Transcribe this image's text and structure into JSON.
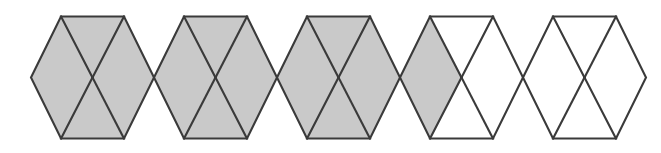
{
  "figure": {
    "shape_name": "hexagon",
    "hexagon_count": 5,
    "parts_per_hexagon": 3,
    "total_parts": 15,
    "shaded_parts": 10,
    "unshaded_parts": 5
  },
  "colors": {
    "shaded_fill": "#c9c9c9",
    "unshaded_fill": "#ffffff",
    "stroke": "#3a3a3a",
    "background": "#ffffff"
  },
  "geometry": {
    "canvas_width": 661,
    "canvas_height": 153,
    "center_y": 77.5,
    "top_y": 16.5,
    "bottom_y": 138.5,
    "left_vertex_x": 31,
    "pitch": 123,
    "top_inset": 30,
    "stroke_width": 2.1
  },
  "hexagons": [
    {
      "index": 1,
      "label": "hexagon-1",
      "cells": [
        {
          "name": "left-triangle",
          "shaded": true
        },
        {
          "name": "center-rhombus",
          "shaded": true
        },
        {
          "name": "right-triangle",
          "shaded": true
        }
      ]
    },
    {
      "index": 2,
      "label": "hexagon-2",
      "cells": [
        {
          "name": "left-triangle",
          "shaded": true
        },
        {
          "name": "center-rhombus",
          "shaded": true
        },
        {
          "name": "right-triangle",
          "shaded": true
        }
      ]
    },
    {
      "index": 3,
      "label": "hexagon-3",
      "cells": [
        {
          "name": "left-triangle",
          "shaded": true
        },
        {
          "name": "center-rhombus",
          "shaded": true
        },
        {
          "name": "right-triangle",
          "shaded": true
        }
      ]
    },
    {
      "index": 4,
      "label": "hexagon-4",
      "cells": [
        {
          "name": "left-triangle",
          "shaded": true
        },
        {
          "name": "center-rhombus",
          "shaded": false
        },
        {
          "name": "right-triangle",
          "shaded": false
        }
      ]
    },
    {
      "index": 5,
      "label": "hexagon-5",
      "cells": [
        {
          "name": "left-triangle",
          "shaded": false
        },
        {
          "name": "center-rhombus",
          "shaded": false
        },
        {
          "name": "right-triangle",
          "shaded": false
        }
      ]
    }
  ]
}
